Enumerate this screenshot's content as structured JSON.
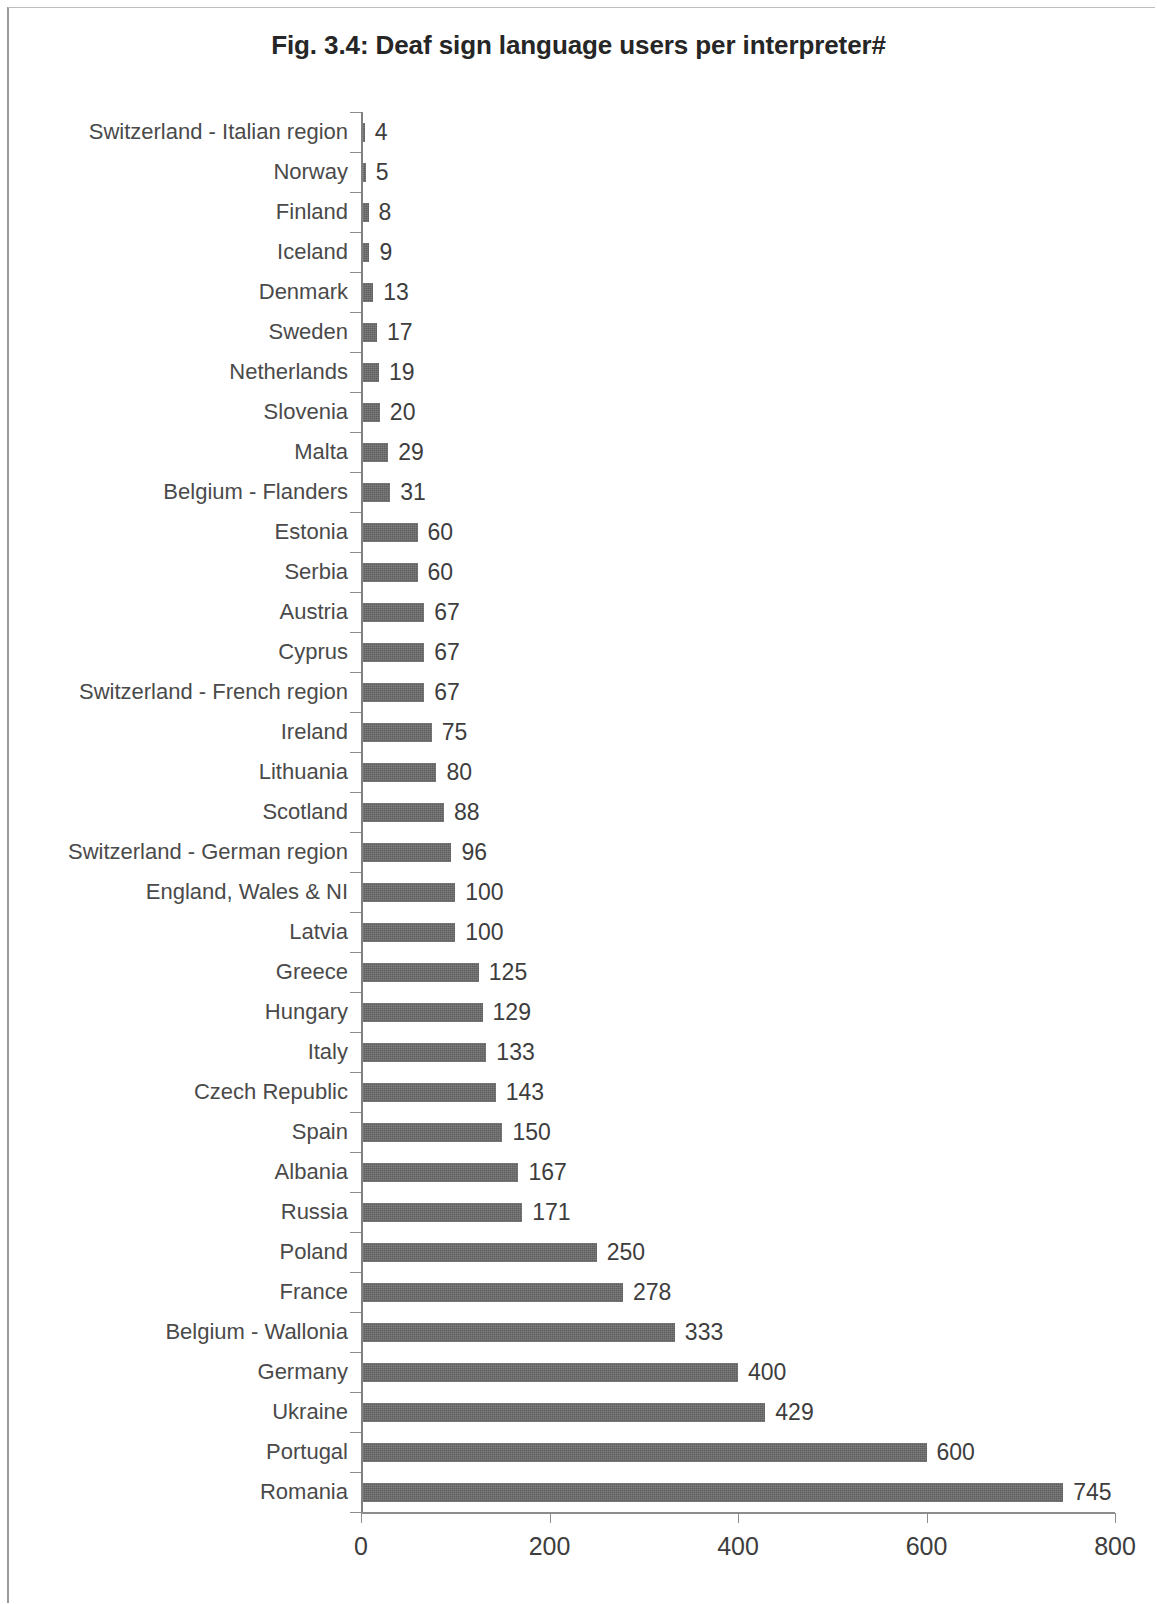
{
  "chart_data": {
    "type": "bar",
    "orientation": "horizontal",
    "title": "Fig. 3.4: Deaf sign language users per interpreter#",
    "xlabel": "",
    "ylabel": "",
    "xlim": [
      0,
      800
    ],
    "xticks": [
      "0",
      "200",
      "400",
      "600",
      "800"
    ],
    "grid": false,
    "legend": null,
    "bar_color": "#5e5e5e",
    "axis_color": "#8c8c8c",
    "categories": [
      "Switzerland - Italian region",
      "Norway",
      "Finland",
      "Iceland",
      "Denmark",
      "Sweden",
      "Netherlands",
      "Slovenia",
      "Malta",
      "Belgium - Flanders",
      "Estonia",
      "Serbia",
      "Austria",
      "Cyprus",
      "Switzerland - French region",
      "Ireland",
      "Lithuania",
      "Scotland",
      "Switzerland - German region",
      "England, Wales & NI",
      "Latvia",
      "Greece",
      "Hungary",
      "Italy",
      "Czech Republic",
      "Spain",
      "Albania",
      "Russia",
      "Poland",
      "France",
      "Belgium - Wallonia",
      "Germany",
      "Ukraine",
      "Portugal",
      "Romania"
    ],
    "values": [
      4,
      5,
      8,
      9,
      13,
      17,
      19,
      20,
      29,
      31,
      60,
      60,
      67,
      67,
      67,
      75,
      80,
      88,
      96,
      100,
      100,
      125,
      129,
      133,
      143,
      150,
      167,
      171,
      250,
      278,
      333,
      400,
      429,
      600,
      745
    ],
    "data_labels": [
      "4",
      "5",
      "8",
      "9",
      "13",
      "17",
      "19",
      "20",
      "29",
      "31",
      "60",
      "60",
      "67",
      "67",
      "67",
      "75",
      "80",
      "88",
      "96",
      "100",
      "100",
      "125",
      "129",
      "133",
      "143",
      "150",
      "167",
      "171",
      "250",
      "278",
      "333",
      "400",
      "429",
      "600",
      "745"
    ]
  }
}
